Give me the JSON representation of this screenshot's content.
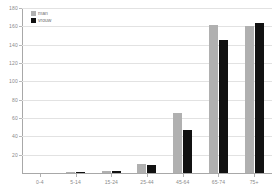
{
  "chart_data": {
    "type": "bar",
    "title": "",
    "xlabel": "",
    "ylabel": "",
    "ylim": [
      0,
      180
    ],
    "yticks": [
      0,
      20,
      40,
      60,
      80,
      100,
      120,
      140,
      160,
      180
    ],
    "ytick_labels": [
      "0",
      "20",
      "40",
      "60",
      "80",
      "100",
      "120",
      "140",
      "160",
      "180"
    ],
    "grid": true,
    "legend_position": "top-left",
    "categories": [
      "0-4",
      "5-14",
      "15-24",
      "25-44",
      "45-64",
      "65-74",
      "75+"
    ],
    "series": [
      {
        "name": "man",
        "color": "#b0b0b0",
        "values": [
          0,
          1,
          2,
          10,
          66,
          162,
          160
        ]
      },
      {
        "name": "vrouw",
        "color": "#111111",
        "values": [
          0,
          1,
          2,
          9,
          47,
          145,
          164
        ]
      }
    ]
  },
  "legend": {
    "items": [
      {
        "label": "man",
        "color": "#b0b0b0"
      },
      {
        "label": "vrouw",
        "color": "#111111"
      }
    ]
  }
}
